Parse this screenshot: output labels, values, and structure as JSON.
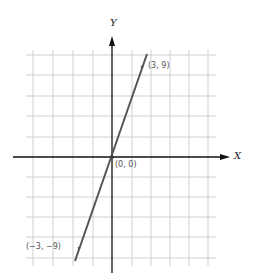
{
  "diagram": {
    "type": "coordinate-graph",
    "x_axis_label": "X",
    "y_axis_label": "Y",
    "line": {
      "equation": "y = 3x",
      "from": [
        -3,
        -9
      ],
      "to": [
        3,
        9
      ]
    },
    "points": [
      {
        "label": "(3, 9)",
        "x": 3,
        "y": 9
      },
      {
        "label": "(0, 0)",
        "x": 0,
        "y": 0
      },
      {
        "label": "(−3, −9)",
        "x": -3,
        "y": -9
      }
    ],
    "colors": {
      "grid": "#cfcfcf",
      "axis": "#111111",
      "line": "#555555"
    }
  }
}
